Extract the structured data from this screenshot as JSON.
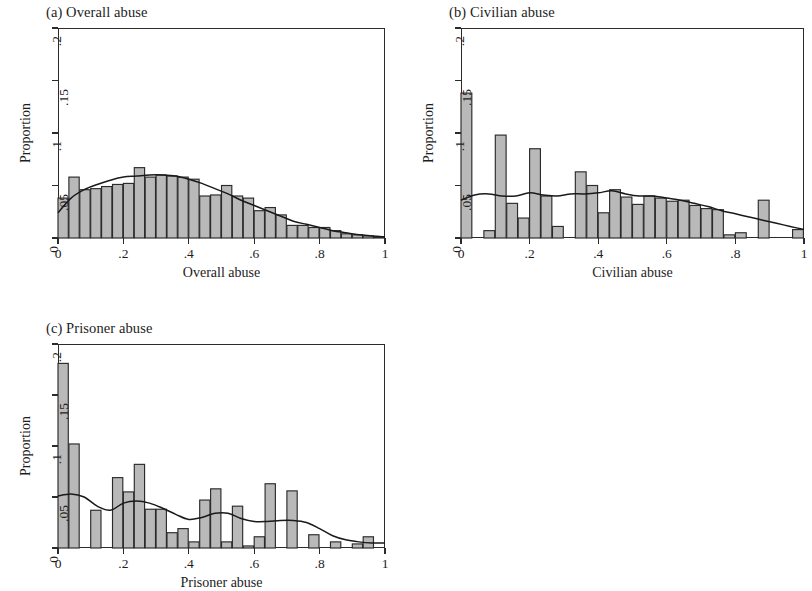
{
  "figure": {
    "background_color": "#ffffff",
    "bar_fill_color": "#b9b9b9",
    "bar_edge_color": "#2b2b2b",
    "density_line_color": "#1a1a1a",
    "axis_color": "#2b2b2b"
  },
  "panels": [
    {
      "key": "a",
      "title": "(a) Overall abuse",
      "xlabel": "Overall abuse",
      "ylabel": "Proportion"
    },
    {
      "key": "b",
      "title": "(b) Civilian abuse",
      "xlabel": "Civilian abuse",
      "ylabel": "Proportion"
    },
    {
      "key": "c",
      "title": "(c) Prisoner abuse",
      "xlabel": "Prisoner abuse",
      "ylabel": "Proportion"
    }
  ],
  "chart_data": [
    {
      "type": "bar",
      "panel": "a",
      "title": "(a) Overall abuse",
      "xlabel": "Overall abuse",
      "ylabel": "Proportion",
      "xlim": [
        0,
        1
      ],
      "ylim": [
        0,
        0.2
      ],
      "xticks": [
        0,
        0.2,
        0.4,
        0.6,
        0.8,
        1
      ],
      "xtick_labels": [
        "0",
        ".2",
        ".4",
        ".6",
        ".8",
        "1"
      ],
      "yticks": [
        0,
        0.05,
        0.1,
        0.15,
        0.2
      ],
      "ytick_labels": [
        "0",
        ".05",
        ".1",
        ".15",
        ".2"
      ],
      "grid": false,
      "legend": "none",
      "bin_width": 0.03333,
      "bin_starts": [
        0.0,
        0.0333,
        0.0667,
        0.1,
        0.1333,
        0.1667,
        0.2,
        0.2333,
        0.2667,
        0.3,
        0.3333,
        0.3667,
        0.4,
        0.4333,
        0.4667,
        0.5,
        0.5333,
        0.5667,
        0.6,
        0.6333,
        0.6667,
        0.7,
        0.7333,
        0.7667,
        0.8,
        0.8333,
        0.8667,
        0.9,
        0.9333,
        0.9667
      ],
      "values": [
        0.038,
        0.058,
        0.046,
        0.047,
        0.049,
        0.051,
        0.052,
        0.067,
        0.058,
        0.06,
        0.059,
        0.058,
        0.056,
        0.04,
        0.041,
        0.05,
        0.04,
        0.038,
        0.026,
        0.029,
        0.022,
        0.012,
        0.012,
        0.01,
        0.01,
        0.007,
        0.004,
        0.003,
        0.002,
        0.001
      ],
      "density_curve": {
        "name": "kernel density",
        "x": [
          0.0,
          0.04,
          0.08,
          0.12,
          0.16,
          0.2,
          0.24,
          0.28,
          0.32,
          0.36,
          0.4,
          0.44,
          0.48,
          0.52,
          0.56,
          0.6,
          0.64,
          0.68,
          0.72,
          0.76,
          0.8,
          0.84,
          0.88,
          0.92,
          0.96,
          1.0
        ],
        "y": [
          0.024,
          0.038,
          0.046,
          0.051,
          0.055,
          0.058,
          0.059,
          0.06,
          0.06,
          0.059,
          0.056,
          0.052,
          0.047,
          0.042,
          0.036,
          0.031,
          0.026,
          0.021,
          0.016,
          0.013,
          0.01,
          0.007,
          0.005,
          0.003,
          0.002,
          0.001
        ]
      }
    },
    {
      "type": "bar",
      "panel": "b",
      "title": "(b) Civilian abuse",
      "xlabel": "Civilian abuse",
      "ylabel": "Proportion",
      "xlim": [
        0,
        1
      ],
      "ylim": [
        0,
        0.2
      ],
      "xticks": [
        0,
        0.2,
        0.4,
        0.6,
        0.8,
        1
      ],
      "xtick_labels": [
        "0",
        ".2",
        ".4",
        ".6",
        ".8",
        "1"
      ],
      "yticks": [
        0,
        0.05,
        0.1,
        0.15,
        0.2
      ],
      "ytick_labels": [
        "0",
        ".05",
        ".1",
        ".15",
        ".2"
      ],
      "grid": false,
      "legend": "none",
      "bin_width": 0.0333,
      "bin_starts": [
        0.0,
        0.0333,
        0.0667,
        0.1,
        0.1333,
        0.1667,
        0.2,
        0.2333,
        0.2667,
        0.3,
        0.3333,
        0.3667,
        0.4,
        0.4333,
        0.4667,
        0.5,
        0.5333,
        0.5667,
        0.6,
        0.6333,
        0.6667,
        0.7,
        0.7333,
        0.7667,
        0.8,
        0.8333,
        0.8667,
        0.9,
        0.9333,
        0.9667
      ],
      "values": [
        0.138,
        0.0,
        0.007,
        0.098,
        0.033,
        0.019,
        0.085,
        0.04,
        0.011,
        0.0,
        0.063,
        0.05,
        0.024,
        0.046,
        0.039,
        0.032,
        0.04,
        0.038,
        0.035,
        0.036,
        0.031,
        0.028,
        0.027,
        0.003,
        0.005,
        0.0,
        0.036,
        0.0,
        0.0,
        0.008
      ],
      "density_curve": {
        "name": "kernel density",
        "x": [
          0.0,
          0.04,
          0.08,
          0.12,
          0.16,
          0.2,
          0.24,
          0.28,
          0.32,
          0.36,
          0.4,
          0.44,
          0.48,
          0.52,
          0.56,
          0.6,
          0.64,
          0.68,
          0.72,
          0.76,
          0.8,
          0.84,
          0.88,
          0.92,
          0.96,
          1.0
        ],
        "y": [
          0.036,
          0.041,
          0.042,
          0.04,
          0.04,
          0.043,
          0.041,
          0.04,
          0.042,
          0.042,
          0.043,
          0.045,
          0.042,
          0.04,
          0.04,
          0.038,
          0.036,
          0.033,
          0.03,
          0.026,
          0.023,
          0.02,
          0.017,
          0.014,
          0.011,
          0.008
        ]
      }
    },
    {
      "type": "bar",
      "panel": "c",
      "title": "(c) Prisoner abuse",
      "xlabel": "Prisoner abuse",
      "ylabel": "Proportion",
      "xlim": [
        0,
        1
      ],
      "ylim": [
        0,
        0.2
      ],
      "xticks": [
        0,
        0.2,
        0.4,
        0.6,
        0.8,
        1
      ],
      "xtick_labels": [
        "0",
        ".2",
        ".4",
        ".6",
        ".8",
        "1"
      ],
      "yticks": [
        0,
        0.05,
        0.1,
        0.15,
        0.2
      ],
      "ytick_labels": [
        "0",
        ".05",
        ".1",
        ".15",
        ".2"
      ],
      "grid": false,
      "legend": "none",
      "bin_width": 0.0333,
      "bin_starts": [
        0.0,
        0.0333,
        0.0667,
        0.1,
        0.1333,
        0.1667,
        0.2,
        0.2333,
        0.2667,
        0.3,
        0.3333,
        0.3667,
        0.4,
        0.4333,
        0.4667,
        0.5,
        0.5333,
        0.5667,
        0.6,
        0.6333,
        0.6667,
        0.7,
        0.7333,
        0.7667,
        0.8,
        0.8333,
        0.8667,
        0.9,
        0.9333,
        0.9667
      ],
      "values": [
        0.181,
        0.102,
        0.0,
        0.037,
        0.0,
        0.069,
        0.055,
        0.082,
        0.038,
        0.038,
        0.015,
        0.019,
        0.006,
        0.047,
        0.058,
        0.006,
        0.041,
        0.002,
        0.011,
        0.063,
        0.0,
        0.056,
        0.0,
        0.013,
        0.0,
        0.006,
        0.0,
        0.004,
        0.011,
        0.0
      ],
      "density_curve": {
        "name": "kernel density",
        "x": [
          0.0,
          0.04,
          0.08,
          0.12,
          0.16,
          0.2,
          0.24,
          0.28,
          0.32,
          0.36,
          0.4,
          0.44,
          0.48,
          0.52,
          0.56,
          0.6,
          0.64,
          0.68,
          0.72,
          0.76,
          0.8,
          0.84,
          0.88,
          0.92,
          0.96,
          1.0
        ],
        "y": [
          0.051,
          0.053,
          0.05,
          0.041,
          0.037,
          0.044,
          0.046,
          0.044,
          0.039,
          0.033,
          0.028,
          0.03,
          0.034,
          0.034,
          0.029,
          0.026,
          0.026,
          0.027,
          0.027,
          0.025,
          0.019,
          0.012,
          0.008,
          0.006,
          0.005,
          0.005
        ]
      }
    }
  ]
}
